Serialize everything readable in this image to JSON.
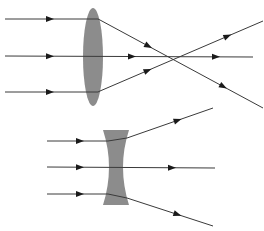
{
  "diagram": {
    "colors": {
      "background": "#ffffff",
      "lens": "#8c8c8c",
      "ray": "#3a3a3a"
    },
    "convex_lens": {
      "label": "converging lens",
      "center": [
        93,
        57
      ],
      "rx": 10,
      "ry": 49,
      "rays": [
        {
          "points": [
            [
              5,
              19
            ],
            [
              98,
              19
            ],
            [
              100,
              20
            ],
            [
              263,
              108
            ]
          ],
          "arrows": [
            [
              50,
              19
            ],
            [
              148,
              47
            ],
            [
              228,
              78
            ]
          ]
        },
        {
          "points": [
            [
              5,
              56
            ],
            [
              253,
              57
            ]
          ],
          "arrows": [
            [
              50,
              56
            ],
            [
              132,
              56
            ],
            [
              216,
              57
            ]
          ]
        },
        {
          "points": [
            [
              5,
              92
            ],
            [
              98,
              92
            ],
            [
              100,
              91
            ],
            [
              263,
              21
            ]
          ],
          "arrows": [
            [
              50,
              92
            ],
            [
              148,
              71
            ],
            [
              228,
              37
            ]
          ]
        }
      ],
      "focal_point": [
        180,
        57
      ]
    },
    "concave_lens": {
      "label": "diverging lens",
      "rays": [
        {
          "points": [
            [
              47,
              141
            ],
            [
              108,
              141
            ],
            [
              127,
              138
            ],
            [
              213,
              108
            ]
          ],
          "arrows": [
            [
              80,
              141
            ],
            [
              178,
              121
            ]
          ]
        },
        {
          "points": [
            [
              47,
              167
            ],
            [
              215,
              168
            ]
          ],
          "arrows": [
            [
              80,
              167
            ],
            [
              172,
              168
            ]
          ]
        },
        {
          "points": [
            [
              47,
              194
            ],
            [
              108,
              194
            ],
            [
              127,
              198
            ],
            [
              213,
              226
            ]
          ],
          "arrows": [
            [
              80,
              194
            ],
            [
              178,
              213
            ]
          ]
        }
      ]
    }
  }
}
